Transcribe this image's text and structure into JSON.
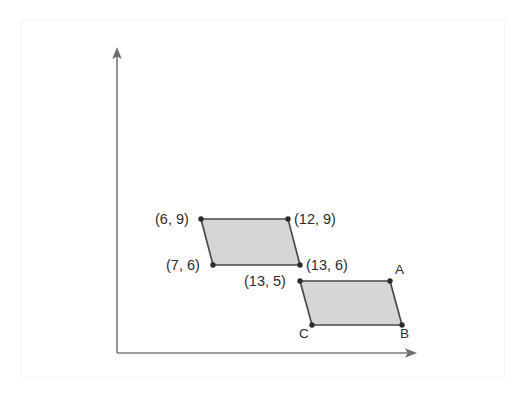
{
  "figure": {
    "background_color": "#ffffff",
    "border_color": "#f4f4f4",
    "axis_color": "#7a7a7a",
    "shape_fill_color": "#d6d6d6",
    "shape_stroke_color": "#4a4a4a",
    "vertex_dot_color": "#2b2b2b",
    "text_color": "#2b2b2b"
  },
  "axes": {
    "x_axis_name": "x-axis",
    "y_axis_name": "y-axis",
    "origin_px": {
      "x": 117,
      "y": 353
    },
    "x_axis_end_px": {
      "x": 416,
      "y": 353
    },
    "y_axis_end_px": {
      "x": 117,
      "y": 50
    },
    "has_arrowheads": true,
    "has_tick_marks": false,
    "has_gridlines": false,
    "tick_labels": []
  },
  "shapes": [
    {
      "name": "parallelogram-1",
      "label": "",
      "filled": true,
      "vertices": [
        {
          "name": "vertex-6-9",
          "label": "(6, 9)",
          "label_side": "left",
          "px": {
            "x": 201,
            "y": 219
          }
        },
        {
          "name": "vertex-12-9",
          "label": "(12, 9)",
          "label_side": "right",
          "px": {
            "x": 288,
            "y": 219
          }
        },
        {
          "name": "vertex-13-6",
          "label": "(13, 6)",
          "label_side": "right",
          "px": {
            "x": 300,
            "y": 265
          }
        },
        {
          "name": "vertex-7-6",
          "label": "(7, 6)",
          "label_side": "left",
          "px": {
            "x": 213,
            "y": 265
          }
        }
      ]
    },
    {
      "name": "parallelogram-2",
      "label": "",
      "filled": true,
      "vertices": [
        {
          "name": "vertex-13-5",
          "label": "(13, 5)",
          "label_side": "left",
          "px": {
            "x": 300,
            "y": 281
          }
        },
        {
          "name": "vertex-a",
          "label": "A",
          "label_side": "right",
          "px": {
            "x": 390,
            "y": 281
          }
        },
        {
          "name": "vertex-b",
          "label": "B",
          "label_side": "right",
          "px": {
            "x": 402,
            "y": 325
          }
        },
        {
          "name": "vertex-c",
          "label": "C",
          "label_side": "left",
          "px": {
            "x": 312,
            "y": 325
          }
        }
      ]
    }
  ],
  "labels": [
    {
      "name": "label-6-9",
      "text": "(6, 9)",
      "left": 155,
      "top": 211
    },
    {
      "name": "label-12-9",
      "text": "(12, 9)",
      "left": 294,
      "top": 211
    },
    {
      "name": "label-7-6",
      "text": "(7, 6)",
      "left": 166,
      "top": 257
    },
    {
      "name": "label-13-6",
      "text": "(13, 6)",
      "left": 306,
      "top": 257
    },
    {
      "name": "label-13-5",
      "text": "(13, 5)",
      "left": 244,
      "top": 273
    },
    {
      "name": "label-a",
      "text": "A",
      "left": 395,
      "top": 262
    },
    {
      "name": "label-b",
      "text": "B",
      "left": 400,
      "top": 326
    },
    {
      "name": "label-c",
      "text": "C",
      "left": 299,
      "top": 326
    }
  ]
}
